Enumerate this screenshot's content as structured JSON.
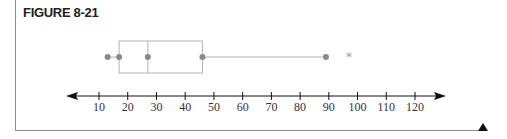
{
  "figure": {
    "title": "FIGURE 8-21"
  },
  "colors": {
    "box": "#b4b4b4",
    "point": "#8a8a8a",
    "axis": "#111111",
    "frame": "#8c8c8c"
  },
  "chart_data": {
    "type": "boxplot",
    "title": "FIGURE 8-21",
    "xlabel": "",
    "ylabel": "",
    "orientation": "horizontal",
    "series": [
      {
        "name": "",
        "min": 13,
        "q1": 17,
        "median": 27,
        "q3": 46,
        "max": 89,
        "outliers": [
          97
        ]
      }
    ],
    "x_ticks": [
      10,
      20,
      30,
      40,
      50,
      60,
      70,
      80,
      90,
      100,
      110,
      120
    ],
    "x_tick_labels": [
      "10",
      "20",
      "30",
      "40",
      "50",
      "60",
      "70",
      "80",
      "90",
      "100",
      "110",
      "120"
    ],
    "xlim": [
      2,
      130
    ],
    "grid": false,
    "legend": null,
    "annotations": [
      "number line with arrows at both ends"
    ]
  }
}
